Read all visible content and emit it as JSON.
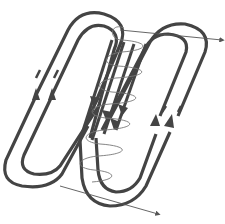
{
  "diagram": {
    "type": "coil-winding-flux-diagram",
    "colors": {
      "background": "#ffffff",
      "conductor": "#444444",
      "coil": "#777777",
      "axis": "#555555"
    },
    "labels": []
  }
}
